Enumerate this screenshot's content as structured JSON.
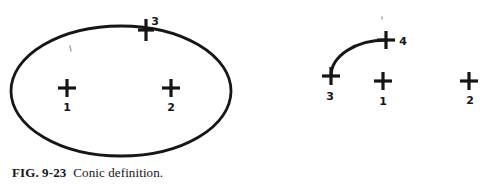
{
  "figure": {
    "caption": {
      "label": "FIG. 9-23",
      "text": "Conic definition."
    },
    "ink_color": "#161616",
    "background_color": "#ffffff",
    "artifact_color": "#8f8f8f",
    "cross_stroke_width": 3.2
  },
  "canvas": {
    "width": 487,
    "height": 192
  },
  "left_figure": {
    "name": "ellipse-conic",
    "ellipse": {
      "cx": 121,
      "cy": 91,
      "rx": 110,
      "ry": 65,
      "stroke_width": 2.8
    },
    "points": [
      {
        "label": "1",
        "x": 67,
        "y": 88,
        "h_arm": 9,
        "v_arm": 9,
        "label_x": 67,
        "label_y": 111
      },
      {
        "label": "2",
        "x": 171,
        "y": 88,
        "h_arm": 9,
        "v_arm": 9,
        "label_x": 171,
        "label_y": 111
      },
      {
        "label": "3",
        "x": 146,
        "y": 30,
        "h_arm": 8,
        "v_arm": 11,
        "label_x": 155,
        "label_y": 25
      }
    ]
  },
  "right_figure": {
    "name": "arc-conic",
    "arc": {
      "x1": 331,
      "y1": 76,
      "x2": 386,
      "y2": 40,
      "rx": 55,
      "ry": 36,
      "stroke_width": 3
    },
    "points": [
      {
        "label": "3",
        "x": 331,
        "y": 76,
        "h_arm": 9,
        "v_arm": 9,
        "label_x": 330,
        "label_y": 100
      },
      {
        "label": "4",
        "x": 386,
        "y": 40,
        "h_arm": 9,
        "v_arm": 9,
        "label_x": 403,
        "label_y": 45
      },
      {
        "label": "1",
        "x": 383,
        "y": 81,
        "h_arm": 9,
        "v_arm": 9,
        "label_x": 383,
        "label_y": 105
      },
      {
        "label": "2",
        "x": 469,
        "y": 81,
        "h_arm": 9,
        "v_arm": 9,
        "label_x": 470,
        "label_y": 104
      }
    ]
  },
  "artifacts": [
    {
      "x1": 70,
      "y1": 46,
      "x2": 71,
      "y2": 51
    },
    {
      "x1": 382,
      "y1": 17,
      "x2": 382,
      "y2": 19
    }
  ]
}
